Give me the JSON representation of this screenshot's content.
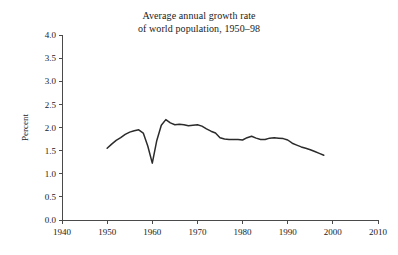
{
  "chart_data": {
    "type": "line",
    "title": "Average annual growth rate of world population, 1950–98",
    "title_line1": "Average annual growth rate",
    "title_line2": "of world population, 1950–98",
    "xlabel": "",
    "ylabel": "Percent",
    "xlim": [
      1940,
      2010
    ],
    "ylim": [
      0.0,
      4.0
    ],
    "grid": false,
    "legend": "none",
    "xticks": [
      1940,
      1950,
      1960,
      1970,
      1980,
      1990,
      2000,
      2010
    ],
    "xtick_labels": [
      "1940",
      "1950",
      "1960",
      "1970",
      "1980",
      "1990",
      "2000",
      "2010"
    ],
    "yticks": [
      0.0,
      0.5,
      1.0,
      1.5,
      2.0,
      2.5,
      3.0,
      3.5,
      4.0
    ],
    "ytick_labels": [
      "0.0",
      "0.5",
      "1.0",
      "1.5",
      "2.0",
      "2.5",
      "3.0",
      "3.5",
      "4.0"
    ],
    "line_color": "#2b2b2b",
    "axis_color": "#4a4a4a",
    "background_color": "#ffffff",
    "series": [
      {
        "name": "World population growth rate",
        "x": [
          1950,
          1951,
          1952,
          1953,
          1954,
          1955,
          1956,
          1957,
          1958,
          1959,
          1960,
          1961,
          1962,
          1963,
          1964,
          1965,
          1966,
          1967,
          1968,
          1969,
          1970,
          1971,
          1972,
          1973,
          1974,
          1975,
          1976,
          1977,
          1978,
          1979,
          1980,
          1981,
          1982,
          1983,
          1984,
          1985,
          1986,
          1987,
          1988,
          1989,
          1990,
          1991,
          1992,
          1993,
          1994,
          1995,
          1996,
          1997,
          1998
        ],
        "values": [
          1.55,
          1.64,
          1.72,
          1.78,
          1.85,
          1.9,
          1.93,
          1.95,
          1.88,
          1.6,
          1.23,
          1.72,
          2.05,
          2.17,
          2.1,
          2.06,
          2.07,
          2.06,
          2.04,
          2.05,
          2.06,
          2.03,
          1.97,
          1.92,
          1.88,
          1.78,
          1.75,
          1.74,
          1.74,
          1.74,
          1.73,
          1.78,
          1.81,
          1.77,
          1.74,
          1.74,
          1.77,
          1.78,
          1.77,
          1.76,
          1.73,
          1.66,
          1.62,
          1.58,
          1.55,
          1.52,
          1.48,
          1.44,
          1.4
        ]
      }
    ]
  }
}
